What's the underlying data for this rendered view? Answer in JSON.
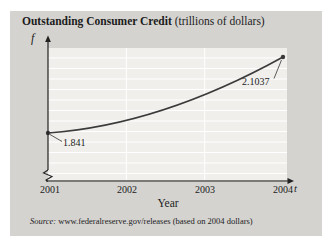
{
  "title": {
    "bold": "Outstanding Consumer Credit",
    "rest": " (trillions of dollars)"
  },
  "chart_data": {
    "type": "line",
    "title": "Outstanding Consumer Credit (trillions of dollars)",
    "x": [
      2001,
      2004
    ],
    "values": [
      1.841,
      2.1037
    ],
    "point_labels": [
      "1.841",
      "2.1037"
    ],
    "x_ticks": [
      "2001",
      "2002",
      "2003",
      "2004"
    ],
    "xlabel": "Year",
    "x_axis_symbol": "t",
    "y_axis_symbol": "f",
    "y_ticks": [],
    "x_range": [
      2001,
      2004
    ],
    "axis_break_on_y": true,
    "grid": "horizontal and vertical white gridlines, no y labels",
    "legend": "none"
  },
  "source": {
    "prefix": "Source:",
    "text": " www.federalreserve.gov/releases (based on 2004 dollars)"
  },
  "colors": {
    "panel_bg": "#d4d3d0",
    "plot_bg": "#f0efec",
    "grid": "#ffffff",
    "line": "#3a3a3a",
    "axis": "#222222",
    "text": "#1c1c1c"
  }
}
